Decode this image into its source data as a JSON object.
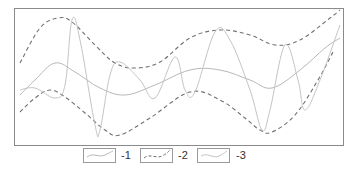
{
  "chart_data": {
    "type": "line",
    "title": "",
    "xlabel": "",
    "ylabel": "",
    "grid": false,
    "axes_ticks": false,
    "legend_position": "bottom-center",
    "frame": {
      "x": 14,
      "y": 8,
      "width": 329,
      "height": 137,
      "color": "#8a8a8a"
    },
    "series": [
      {
        "name": "-1",
        "style": "solid",
        "color": "#b8b8b8",
        "points": [
          [
            20,
            95
          ],
          [
            35,
            80
          ],
          [
            55,
            63
          ],
          [
            75,
            72
          ],
          [
            100,
            88
          ],
          [
            125,
            95
          ],
          [
            155,
            85
          ],
          [
            190,
            70
          ],
          [
            220,
            70
          ],
          [
            250,
            80
          ],
          [
            272,
            88
          ],
          [
            300,
            70
          ],
          [
            325,
            48
          ],
          [
            340,
            38
          ]
        ]
      },
      {
        "name": "-2",
        "style": "dashed",
        "color": "#707070",
        "role": "envelope-upper",
        "points": [
          [
            20,
            63
          ],
          [
            40,
            28
          ],
          [
            58,
            18
          ],
          [
            72,
            22
          ],
          [
            95,
            45
          ],
          [
            115,
            63
          ],
          [
            135,
            68
          ],
          [
            160,
            62
          ],
          [
            190,
            38
          ],
          [
            220,
            30
          ],
          [
            250,
            35
          ],
          [
            275,
            45
          ],
          [
            300,
            40
          ],
          [
            330,
            18
          ],
          [
            340,
            10
          ]
        ]
      },
      {
        "name": "-2",
        "style": "dashed",
        "color": "#707070",
        "role": "envelope-lower",
        "points": [
          [
            20,
            112
          ],
          [
            35,
            98
          ],
          [
            50,
            90
          ],
          [
            65,
            97
          ],
          [
            85,
            113
          ],
          [
            105,
            130
          ],
          [
            120,
            135
          ],
          [
            150,
            118
          ],
          [
            190,
            92
          ],
          [
            220,
            100
          ],
          [
            245,
            118
          ],
          [
            260,
            130
          ],
          [
            272,
            132
          ],
          [
            295,
            115
          ],
          [
            318,
            80
          ],
          [
            333,
            52
          ]
        ]
      },
      {
        "name": "-3",
        "style": "solid",
        "color": "#c4c4c4",
        "points": [
          [
            20,
            90
          ],
          [
            35,
            88
          ],
          [
            55,
            98
          ],
          [
            65,
            85
          ],
          [
            72,
            20
          ],
          [
            80,
            40
          ],
          [
            95,
            125
          ],
          [
            100,
            130
          ],
          [
            110,
            75
          ],
          [
            120,
            62
          ],
          [
            140,
            80
          ],
          [
            155,
            98
          ],
          [
            175,
            57
          ],
          [
            185,
            90
          ],
          [
            195,
            92
          ],
          [
            215,
            32
          ],
          [
            230,
            40
          ],
          [
            250,
            90
          ],
          [
            262,
            130
          ],
          [
            270,
            110
          ],
          [
            285,
            45
          ],
          [
            298,
            80
          ],
          [
            305,
            110
          ],
          [
            320,
            80
          ],
          [
            340,
            25
          ]
        ]
      }
    ]
  },
  "legend": {
    "items": [
      {
        "label": "-1",
        "style": "solid",
        "color": "#b8b8b8"
      },
      {
        "label": "-2",
        "style": "dashed",
        "color": "#707070"
      },
      {
        "label": "-3",
        "style": "solid",
        "color": "#c4c4c4"
      }
    ]
  }
}
